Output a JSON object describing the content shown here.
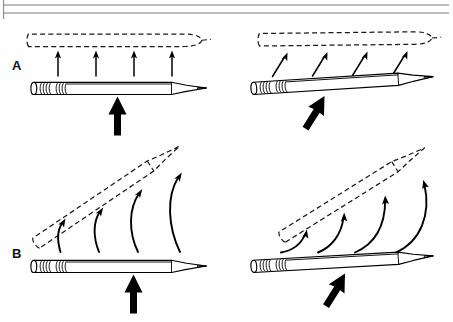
{
  "figure": {
    "background_color": "#fefefe",
    "ink_color": "#000000",
    "rule_color": "#7a7a7a",
    "width": 453,
    "height": 322
  },
  "header_rules": {
    "name": "double-rule",
    "line_top_y": 5,
    "line_bottom_y": 13,
    "x_start": 3,
    "x_end": 449,
    "left_tick": {
      "x": 3,
      "y_top": 0,
      "y_bottom": 19
    }
  },
  "panels": [
    {
      "id": "A",
      "label": "A",
      "label_x": 12,
      "label_y": 70,
      "caption": "Translation: force applied through the center of mass",
      "cells": [
        {
          "id": "A-left",
          "name": "pencil-perpendicular-force",
          "force_label": "perpendicular force",
          "force_direction": "up",
          "displacement": "straight up, no rotation",
          "thin_arrow_count": 4,
          "ghost_style": "dashed outline above pencil",
          "pencil_angle_deg": 0
        },
        {
          "id": "A-right",
          "name": "pencil-oblique-force",
          "force_label": "oblique force",
          "force_direction": "up and to the right",
          "displacement": "diagonal, no rotation",
          "thin_arrow_count": 4,
          "ghost_style": "dashed outline above and right of pencil",
          "pencil_angle_deg": -4
        }
      ]
    },
    {
      "id": "B",
      "label": "B",
      "label_x": 12,
      "label_y": 258,
      "caption": "Rotation: force applied off the center of mass",
      "cells": [
        {
          "id": "B-left",
          "name": "pencil-perpendicular-force-rotation",
          "force_label": "perpendicular force",
          "force_direction": "up",
          "displacement": "rotation about the eraser end",
          "curved_arrow_count": 4,
          "ghost_style": "dashed outline rotated counter-clockwise",
          "pencil_angle_deg": 0
        },
        {
          "id": "B-right",
          "name": "pencil-oblique-force-rotation",
          "force_label": "oblique force",
          "force_direction": "up and to the right",
          "displacement": "rotation about the eraser end",
          "curved_arrow_count": 4,
          "ghost_style": "dashed outline rotated counter-clockwise",
          "pencil_angle_deg": -4
        }
      ]
    }
  ],
  "legend": {
    "bold_arrow_meaning": "applied force",
    "thin_arrow_meaning": "direction of displacement",
    "curved_arrow_meaning": "direction of rotation",
    "dashed_outline_meaning": "final position of the pencil"
  }
}
